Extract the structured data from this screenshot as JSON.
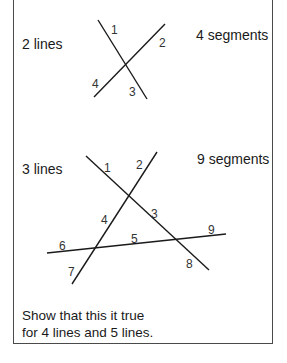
{
  "diagram_1": {
    "lines_label": "2 lines",
    "segments_label": "4 segments",
    "segment_numbers": [
      "1",
      "2",
      "3",
      "4"
    ]
  },
  "diagram_2": {
    "lines_label": "3 lines",
    "segments_label": "9 segments",
    "segment_numbers": [
      "1",
      "2",
      "3",
      "4",
      "5",
      "6",
      "7",
      "8",
      "9"
    ]
  },
  "instruction": {
    "line1": "Show that this it true",
    "line2": "for 4 lines and 5 lines."
  },
  "colors": {
    "line": "#1a1a1a",
    "border": "#4a4a4a"
  }
}
